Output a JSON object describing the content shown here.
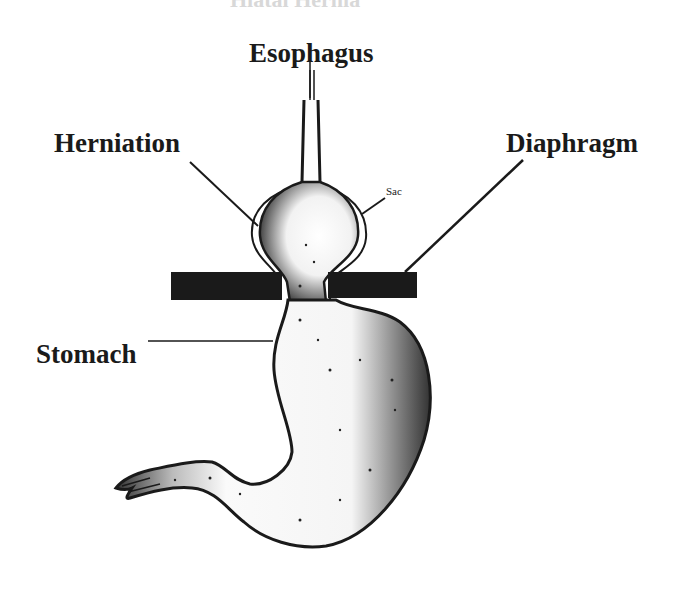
{
  "diagram": {
    "title_cut": "Hiatal Hernia",
    "labels": {
      "esophagus": "Esophagus",
      "herniation": "Herniation",
      "diaphragm": "Diaphragm",
      "stomach": "Stomach",
      "sac": "Sac"
    },
    "colors": {
      "ink": "#1a1a1a",
      "background": "#ffffff",
      "shade": "#555555"
    }
  }
}
